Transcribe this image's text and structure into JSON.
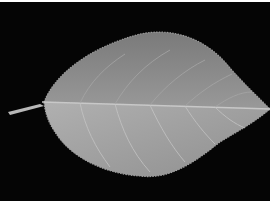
{
  "image": {
    "subject": "Single leaf on black background",
    "alt": "Grayscale photograph of a serrated ovate leaf with stem pointing left and tip pointing right",
    "background_color": "#050505",
    "border_color": "#ffffff",
    "leaf_upper_color": "#8c8c8c",
    "leaf_lower_color": "#a8a8a8",
    "vein_color": "#c0c0c0"
  }
}
